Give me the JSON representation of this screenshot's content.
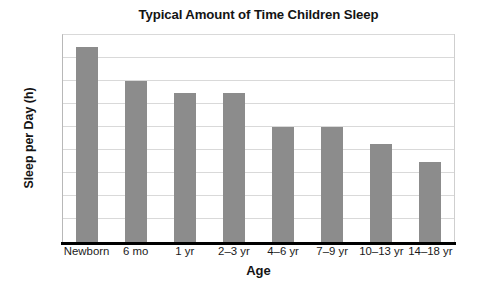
{
  "chart_data": {
    "type": "bar",
    "title": "Typical Amount of Time Children Sleep",
    "xlabel": "Age",
    "ylabel": "Sleep per Day (h)",
    "categories": [
      "Newborn",
      "6 mo",
      "1 yr",
      "2–3 yr",
      "4–6 yr",
      "7–9 yr",
      "10–13 yr",
      "14–18 yr"
    ],
    "values": [
      17,
      14,
      13,
      13,
      10,
      10,
      8.5,
      7
    ],
    "ylim": [
      0,
      18
    ],
    "yticks": [
      0,
      2,
      4,
      6,
      8,
      10,
      12,
      14,
      16,
      18
    ],
    "ytick_labels": [
      "0",
      "2",
      "4",
      "6",
      "8",
      "10",
      "12",
      "14",
      "16",
      "18"
    ],
    "grid": "horizontal",
    "legend": "none",
    "bar_color": "#8c8c8c",
    "gridline_color": "#d9d9d9",
    "axis_color": "#000000",
    "text_color": "#1a1a1a"
  }
}
